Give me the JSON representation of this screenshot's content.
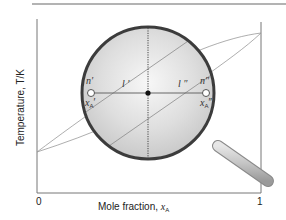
{
  "figure": {
    "xaxis": {
      "label_prefix": "Mole fraction, ",
      "label_var": "x",
      "label_sub": "A",
      "tick_min": "0",
      "tick_max": "1"
    },
    "yaxis": {
      "label": "Temperature, T/K"
    },
    "points": {
      "left_phase": "n′",
      "right_phase": "n″",
      "left_comp_var": "x",
      "left_comp_sub": "A",
      "left_comp_prime": "′",
      "right_comp_var": "x",
      "right_comp_sub": "A",
      "right_comp_prime": "″",
      "left_length": "l ′",
      "right_length": "l ″"
    },
    "colors": {
      "axis": "#777777",
      "curve": "#888888",
      "lens_fill": "#d9d9d9",
      "lens_rim": "#444444",
      "tie_line": "#666666",
      "handle": "#bdbdbd"
    }
  }
}
